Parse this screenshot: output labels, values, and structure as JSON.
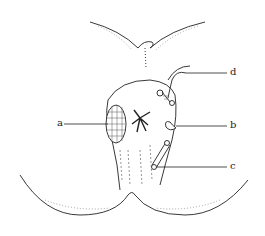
{
  "diagram": {
    "type": "anatomical-illustration",
    "labels": [
      {
        "id": "a",
        "text": "a",
        "x": 59,
        "y": 124,
        "line_to": [
          108,
          124
        ]
      },
      {
        "id": "b",
        "text": "b",
        "x": 230,
        "y": 126,
        "line_to": [
          172,
          126
        ]
      },
      {
        "id": "c",
        "text": "c",
        "x": 230,
        "y": 167,
        "line_to": [
          160,
          167
        ]
      },
      {
        "id": "d",
        "text": "d",
        "x": 230,
        "y": 73,
        "line_to": [
          186,
          73
        ]
      }
    ],
    "colors": {
      "ink": "#222222",
      "background": "#ffffff"
    }
  }
}
